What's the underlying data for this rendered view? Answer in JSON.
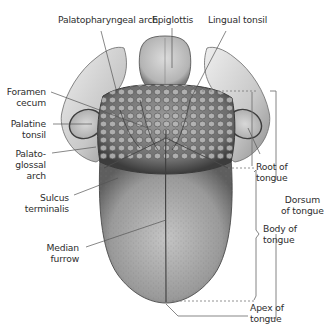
{
  "figure": {
    "labels": {
      "palatopharyngeal_arch": "Palatopharyngeal arch",
      "epiglottis": "Epiglottis",
      "lingual_tonsil": "Lingual tonsil",
      "foramen_cecum": [
        "Foramen",
        "cecum"
      ],
      "palatine_tonsil": [
        "Palatine",
        "tonsil"
      ],
      "palatoglossal_arch": [
        "Palato-",
        "glossal",
        "arch"
      ],
      "sulcus_terminalis": [
        "Sulcus",
        "terminalis"
      ],
      "median_furrow": [
        "Median",
        "furrow"
      ],
      "root_of_tongue": [
        "Root of",
        "tongue"
      ],
      "body_of_tongue": [
        "Body of",
        "tongue"
      ],
      "apex_of_tongue": [
        "Apex of",
        "tongue"
      ],
      "dorsum_of_tongue": [
        "Dorsum",
        "of tongue"
      ]
    },
    "colors": {
      "label_text": "#2e2e2e",
      "leader_line": "#555555",
      "tissue_light": "#d9d9d9",
      "tissue_mid": "#a8a8a8",
      "tissue_dark": "#5a5a5a",
      "background": "#ffffff"
    }
  }
}
